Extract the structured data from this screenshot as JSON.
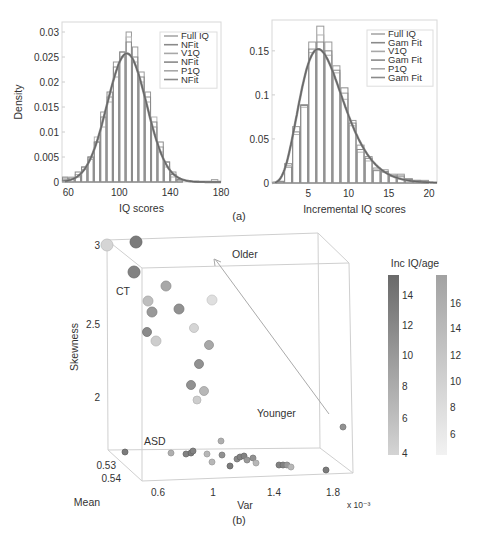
{
  "figure": {
    "caption_a": "(a)",
    "caption_b": "(b)"
  },
  "chart_data": [
    {
      "id": "hist_iq",
      "type": "bar",
      "title": "",
      "xlabel": "IQ scores",
      "ylabel": "Density",
      "xlim": [
        55,
        180
      ],
      "ylim": [
        0,
        0.032
      ],
      "xticks": [
        60,
        100,
        140,
        180
      ],
      "yticks": [
        0,
        0.005,
        0.01,
        0.015,
        0.02,
        0.025,
        0.03
      ],
      "ytick_labels": [
        "0",
        "0.005",
        "0.01",
        "0.015",
        "0.02",
        "0.025",
        "0.03"
      ],
      "grid": false,
      "legend_position": "upper right",
      "legend": [
        "Full IQ",
        "NFit",
        "V1Q",
        "NFit",
        "P1Q",
        "NFit"
      ],
      "bin_edges": [
        55,
        60,
        65,
        70,
        75,
        80,
        85,
        90,
        95,
        100,
        105,
        110,
        115,
        120,
        125,
        130,
        135,
        140,
        145,
        150
      ],
      "series": [
        {
          "name": "Full IQ",
          "kind": "histogram",
          "values": [
            0.001,
            0.0005,
            0.001,
            0.003,
            0.005,
            0.008,
            0.014,
            0.017,
            0.024,
            0.026,
            0.03,
            0.027,
            0.022,
            0.018,
            0.011,
            0.007,
            0.004,
            0.002,
            0.0005
          ]
        },
        {
          "name": "V1Q",
          "kind": "histogram",
          "values": [
            0.0005,
            0.001,
            0.0015,
            0.0025,
            0.0045,
            0.009,
            0.011,
            0.016,
            0.021,
            0.025,
            0.029,
            0.024,
            0.02,
            0.016,
            0.013,
            0.006,
            0.003,
            0.001,
            0.0003
          ]
        },
        {
          "name": "P1Q",
          "kind": "histogram",
          "values": [
            0.0008,
            0.0008,
            0.002,
            0.003,
            0.005,
            0.008,
            0.013,
            0.018,
            0.023,
            0.026,
            0.028,
            0.025,
            0.021,
            0.017,
            0.012,
            0.008,
            0.004,
            0.0015,
            0.0005
          ]
        },
        {
          "name": "NFit",
          "kind": "normal_fit",
          "mean": 106,
          "sd": 15.5,
          "peak": 0.0257
        }
      ],
      "outlier_bin": {
        "x": 175,
        "value": 0.0005
      }
    },
    {
      "id": "hist_inc_iq",
      "type": "bar",
      "title": "",
      "xlabel": "Incremental IQ scores",
      "ylabel": "",
      "xlim": [
        0.5,
        21
      ],
      "ylim": [
        0,
        0.185
      ],
      "xticks": [
        5,
        10,
        15,
        20
      ],
      "yticks": [
        0,
        0.05,
        0.1,
        0.15
      ],
      "ytick_labels": [
        "0",
        "0.05",
        "0.1",
        "0.15"
      ],
      "grid": false,
      "legend_position": "upper right",
      "legend": [
        "Full IQ",
        "Gam Fit",
        "V1Q",
        "Gam Fit",
        "P1Q",
        "Gam Fit"
      ],
      "bin_edges": [
        1,
        2,
        3,
        4,
        5,
        6,
        7,
        8,
        9,
        10,
        11,
        12,
        13,
        14,
        15,
        16,
        17,
        18,
        19,
        20
      ],
      "series": [
        {
          "name": "Full IQ",
          "kind": "histogram",
          "values": [
            0.002,
            0.022,
            0.064,
            0.089,
            0.16,
            0.178,
            0.16,
            0.133,
            0.102,
            0.071,
            0.043,
            0.03,
            0.017,
            0.015,
            0.01,
            0.01,
            0.005,
            0.003,
            0.003
          ]
        },
        {
          "name": "V1Q",
          "kind": "histogram",
          "values": [
            0.001,
            0.02,
            0.055,
            0.086,
            0.148,
            0.168,
            0.145,
            0.125,
            0.095,
            0.065,
            0.035,
            0.025,
            0.015,
            0.012,
            0.009,
            0.007,
            0.004,
            0.002,
            0.002
          ]
        },
        {
          "name": "P1Q",
          "kind": "histogram",
          "values": [
            0.0015,
            0.018,
            0.058,
            0.088,
            0.152,
            0.16,
            0.15,
            0.128,
            0.108,
            0.068,
            0.038,
            0.028,
            0.014,
            0.013,
            0.008,
            0.008,
            0.004,
            0.003,
            0.002
          ]
        },
        {
          "name": "Gam Fit",
          "kind": "gamma_fit",
          "shape": 6.2,
          "scale": 1.2,
          "peak": 0.152
        }
      ]
    },
    {
      "id": "scatter3d",
      "type": "scatter",
      "title": "",
      "xlabel": "Var",
      "x_multiplier": "x 10⁻³",
      "ylabel": "Mean",
      "zlabel": "Skewness",
      "xticks": [
        "0.6",
        "1",
        "1.4",
        "1.8"
      ],
      "yticks": [
        "0.53",
        "0.54"
      ],
      "zticks": [
        "2",
        "2.5",
        "3"
      ],
      "annotations": [
        "Older",
        "Younger",
        "CT",
        "ASD"
      ],
      "arrow": {
        "from": "Younger",
        "to": "Older"
      },
      "colorbar": {
        "title": "Inc IQ/age",
        "left_ticks": [
          "14",
          "12",
          "10",
          "8",
          "6",
          "4"
        ],
        "right_ticks": [
          "16",
          "14",
          "12",
          "10",
          "8",
          "6"
        ]
      },
      "series": [
        {
          "name": "CT",
          "points_screen": [
            [
              107,
              245,
              6,
              0.15
            ],
            [
              136,
              242,
              6,
              0.75
            ],
            [
              134,
              272,
              6,
              0.7
            ],
            [
              166,
              286,
              5,
              0.45
            ],
            [
              148,
              301,
              5,
              0.3
            ],
            [
              152,
              312,
              5,
              0.55
            ],
            [
              179,
              309,
              5,
              0.6
            ],
            [
              212,
              300,
              5,
              0.08
            ],
            [
              147,
              332,
              4.5,
              0.65
            ],
            [
              156,
              341,
              5,
              0.2
            ],
            [
              194,
              328,
              4.5,
              0.15
            ],
            [
              209,
              345,
              4.5,
              0.45
            ],
            [
              199,
              364,
              4.5,
              0.6
            ],
            [
              191,
              385,
              4.5,
              0.6
            ],
            [
              204,
              391,
              4.5,
              0.35
            ],
            [
              197,
              400,
              4,
              0.2
            ]
          ]
        },
        {
          "name": "ASD",
          "points_screen": [
            [
              343,
              427,
              3,
              0.6
            ],
            [
              125,
              452,
              3,
              0.75
            ],
            [
              171,
              453,
              3,
              0.4
            ],
            [
              186,
              454,
              3,
              0.7
            ],
            [
              191,
              453,
              3,
              0.75
            ],
            [
              193,
              451,
              3,
              0.7
            ],
            [
              207,
              454,
              3,
              0.35
            ],
            [
              212,
              462,
              3,
              0.35
            ],
            [
              222,
              455,
              3,
              0.6
            ],
            [
              221,
              441,
              3,
              0.4
            ],
            [
              230,
              466,
              3,
              0.75
            ],
            [
              237,
              459,
              3,
              0.65
            ],
            [
              240,
              457,
              3,
              0.7
            ],
            [
              244,
              456,
              3,
              0.7
            ],
            [
              247,
              460,
              3,
              0.55
            ],
            [
              253,
              458,
              3,
              0.6
            ],
            [
              256,
              463,
              3,
              0.35
            ],
            [
              279,
              465,
              3,
              0.7
            ],
            [
              283,
              465,
              3,
              0.7
            ],
            [
              287,
              465,
              3,
              0.55
            ],
            [
              291,
              467,
              3,
              0.35
            ],
            [
              326,
              470,
              3,
              0.75
            ]
          ]
        }
      ]
    }
  ]
}
